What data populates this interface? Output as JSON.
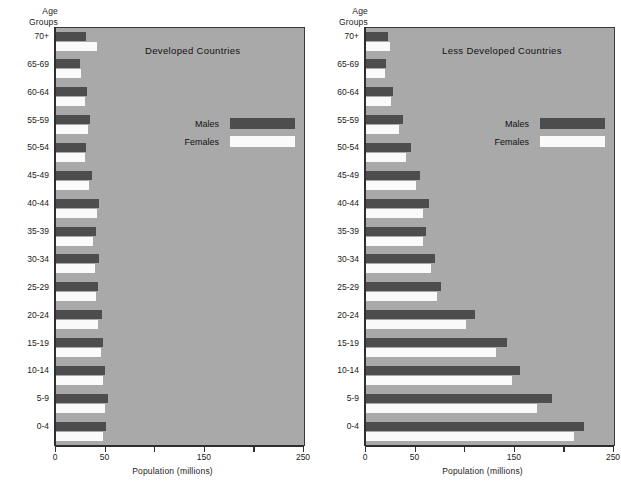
{
  "figure": {
    "y_axis_title_line1": "Age",
    "y_axis_title_line2": "Groups",
    "x_axis_label": "Population (millions)",
    "colors": {
      "male_bar": "#4d4d4d",
      "female_bar": "#fafafa",
      "plot_background": "#a9a9a9",
      "page_background": "#ffffff",
      "axis": "#2e2e2e"
    },
    "legend": {
      "males_label": "Males",
      "females_label": "Females"
    }
  },
  "chart_data": [
    {
      "type": "bar",
      "title": "Developed Countries",
      "xlabel": "Population (millions)",
      "ylabel": "Age Groups",
      "orientation": "horizontal",
      "xlim": [
        0,
        250
      ],
      "xticks": [
        0,
        50,
        100,
        150,
        200,
        250
      ],
      "xtick_labels": [
        "0",
        "50",
        "",
        "150",
        "",
        "250"
      ],
      "grid": false,
      "legend_position": "upper-right-inside",
      "categories": [
        "70+",
        "65-69",
        "60-64",
        "55-59",
        "50-54",
        "45-49",
        "40-44",
        "35-39",
        "30-34",
        "25-29",
        "20-24",
        "15-19",
        "10-14",
        "5-9",
        "0-4"
      ],
      "series": [
        {
          "name": "Males",
          "color": "#4d4d4d",
          "values": [
            30,
            24,
            31,
            34,
            30,
            36,
            43,
            40,
            43,
            42,
            46,
            47,
            49,
            52,
            50
          ]
        },
        {
          "name": "Females",
          "color": "#fafafa",
          "values": [
            41,
            25,
            29,
            32,
            29,
            33,
            41,
            37,
            39,
            40,
            42,
            45,
            47,
            49,
            47
          ]
        }
      ]
    },
    {
      "type": "bar",
      "title": "Less Developed Countries",
      "xlabel": "Population (millions)",
      "ylabel": "Age Groups",
      "orientation": "horizontal",
      "xlim": [
        0,
        250
      ],
      "xticks": [
        0,
        50,
        100,
        150,
        200,
        250
      ],
      "xtick_labels": [
        "0",
        "50",
        "",
        "150",
        "",
        "250"
      ],
      "grid": false,
      "legend_position": "upper-right-inside",
      "categories": [
        "70+",
        "65-69",
        "60-64",
        "55-59",
        "50-54",
        "45-49",
        "40-44",
        "35-39",
        "30-34",
        "25-29",
        "20-24",
        "15-19",
        "10-14",
        "5-9",
        "0-4"
      ],
      "series": [
        {
          "name": "Males",
          "color": "#4d4d4d",
          "values": [
            22,
            20,
            27,
            37,
            45,
            54,
            64,
            60,
            70,
            76,
            110,
            142,
            155,
            188,
            220
          ]
        },
        {
          "name": "Females",
          "color": "#fafafa",
          "values": [
            24,
            19,
            25,
            33,
            40,
            50,
            57,
            57,
            66,
            72,
            101,
            131,
            147,
            172,
            210
          ]
        }
      ]
    }
  ],
  "panels": [
    {
      "id": "developed",
      "title": "Developed Countries"
    },
    {
      "id": "less-developed",
      "title": "Less Developed Countries"
    }
  ]
}
